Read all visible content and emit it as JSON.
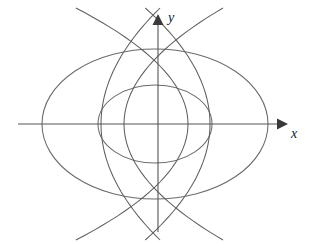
{
  "figure": {
    "background_color": "#ffffff",
    "width": 311,
    "height": 244
  },
  "axes": {
    "x_label": "x",
    "y_label": "y",
    "origin": {
      "x": 158,
      "y": 124
    },
    "color": "#555555",
    "x_axis_start": {
      "x": 18,
      "y": 124
    },
    "x_axis_end": {
      "x": 288,
      "y": 124
    },
    "y_axis_start": {
      "x": 158,
      "y": 232
    },
    "y_axis_end": {
      "x": 158,
      "y": 14
    },
    "arrow_color": "#3a3a3a"
  },
  "chart_data": {
    "type": "line",
    "xlabel": "x",
    "ylabel": "y",
    "grid": false,
    "legend": "none",
    "curve_color": "#6b6b6b",
    "series": [
      {
        "name": "outer-ellipse",
        "kind": "ellipse",
        "center": {
          "x": 155,
          "y": 124
        },
        "semi_axis_x": 113,
        "semi_axis_y": 75,
        "left_vertex_px": 42,
        "right_vertex_px": 268,
        "top_vertex_px": 49,
        "bottom_vertex_px": 199
      },
      {
        "name": "inner-ellipse",
        "kind": "ellipse",
        "center": {
          "x": 155,
          "y": 124
        },
        "semi_axis_x": 57,
        "semi_axis_y": 39,
        "left_vertex_px": 98,
        "right_vertex_px": 212,
        "top_vertex_px": 85,
        "bottom_vertex_px": 163
      },
      {
        "name": "parabola-left-outer",
        "kind": "parabola",
        "opens": "left",
        "focus": {
          "x": 158,
          "y": 124
        },
        "vertex_px": {
          "x": 101,
          "y": 124
        },
        "top_exit_px": {
          "x": 78,
          "y": 8
        },
        "bottom_exit_px": {
          "x": 78,
          "y": 240
        }
      },
      {
        "name": "parabola-left-inner",
        "kind": "parabola",
        "opens": "left",
        "focus": {
          "x": 158,
          "y": 124
        },
        "vertex_px": {
          "x": 124,
          "y": 124
        },
        "top_exit_px": {
          "x": 101,
          "y": 8
        },
        "bottom_exit_px": {
          "x": 105,
          "y": 240
        }
      },
      {
        "name": "parabola-right-inner",
        "kind": "parabola",
        "opens": "right",
        "focus": {
          "x": 158,
          "y": 124
        },
        "vertex_px": {
          "x": 188,
          "y": 124
        },
        "top_exit_px": {
          "x": 208,
          "y": 8
        },
        "bottom_exit_px": {
          "x": 213,
          "y": 240
        }
      },
      {
        "name": "parabola-right-outer",
        "kind": "parabola",
        "opens": "right",
        "focus": {
          "x": 158,
          "y": 124
        },
        "vertex_px": {
          "x": 210,
          "y": 124
        },
        "top_exit_px": {
          "x": 230,
          "y": 8
        },
        "bottom_exit_px": {
          "x": 238,
          "y": 240
        }
      }
    ]
  }
}
